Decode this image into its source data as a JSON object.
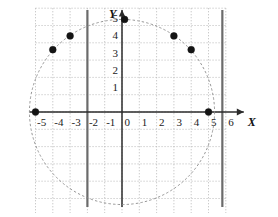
{
  "chart_data": {
    "type": "scatter",
    "title": "",
    "subtitle": "",
    "xlabel": "X",
    "ylabel": "Y",
    "xlim": [
      -5.9,
      6.7
    ],
    "ylim": [
      -6.1,
      6.2
    ],
    "grid": true,
    "grid_step": 1,
    "legend": "none",
    "x_tick_labels": [
      "-5",
      "-4",
      "-3",
      "-2",
      "-1",
      "0",
      "1",
      "2",
      "3",
      "4",
      "5",
      "6"
    ],
    "x_tick_values": [
      -5,
      -4,
      -3,
      -2,
      -1,
      0,
      1,
      2,
      3,
      4,
      5,
      6
    ],
    "y_tick_labels": [
      "1",
      "2",
      "3",
      "4",
      "5"
    ],
    "y_tick_values": [
      1,
      2,
      3,
      4,
      5
    ],
    "circle": {
      "center_x": 0,
      "center_y": 0,
      "radius": 5.35,
      "style": "dashed"
    },
    "vertical_lines": [
      {
        "x": -2,
        "style": "solid-thick"
      },
      {
        "x": 5.8,
        "style": "solid-thick"
      }
    ],
    "points": [
      {
        "x": -5,
        "y": 0
      },
      {
        "x": -4,
        "y": 3.6
      },
      {
        "x": -3,
        "y": 4.4
      },
      {
        "x": 0.15,
        "y": 5.35
      },
      {
        "x": 3,
        "y": 4.4
      },
      {
        "x": 4,
        "y": 3.6
      },
      {
        "x": 5,
        "y": 0
      }
    ],
    "axis_arrows": [
      "x-right",
      "y-up"
    ]
  },
  "colors": {
    "background": "#ffffff",
    "axis": "#2b2b2b",
    "grid": "#b8b8b8",
    "curve": "#8a8a8a",
    "point": "#141414",
    "thick_line": "#6b6b6b",
    "label": "#1a1a1a"
  },
  "axes": {
    "x_name": "X",
    "y_name": "Y"
  }
}
